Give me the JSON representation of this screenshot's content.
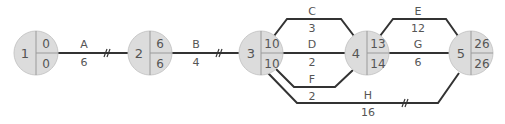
{
  "colors": {
    "node_fill": "#dcdcdc",
    "node_stroke": "#c8c8c8",
    "divider": "#9a9a9a",
    "edge": "#333333",
    "text": "#555555",
    "background": "#ffffff"
  },
  "nodes": [
    {
      "id": "1",
      "earliest": "0",
      "latest": "0"
    },
    {
      "id": "2",
      "earliest": "6",
      "latest": "6"
    },
    {
      "id": "3",
      "earliest": "10",
      "latest": "10"
    },
    {
      "id": "4",
      "earliest": "13",
      "latest": "14"
    },
    {
      "id": "5",
      "earliest": "26",
      "latest": "26"
    }
  ],
  "activities": [
    {
      "name": "A",
      "duration": "6",
      "from": "1",
      "to": "2",
      "critical": true
    },
    {
      "name": "B",
      "duration": "4",
      "from": "2",
      "to": "3",
      "critical": true
    },
    {
      "name": "C",
      "duration": "3",
      "from": "3",
      "to": "4",
      "critical": false
    },
    {
      "name": "D",
      "duration": "2",
      "from": "3",
      "to": "4",
      "critical": false
    },
    {
      "name": "F",
      "duration": "2",
      "from": "3",
      "to": "4",
      "critical": false
    },
    {
      "name": "E",
      "duration": "12",
      "from": "4",
      "to": "5",
      "critical": false
    },
    {
      "name": "G",
      "duration": "6",
      "from": "4",
      "to": "5",
      "critical": false
    },
    {
      "name": "H",
      "duration": "16",
      "from": "3",
      "to": "5",
      "critical": true
    }
  ],
  "critical_marker": "//"
}
